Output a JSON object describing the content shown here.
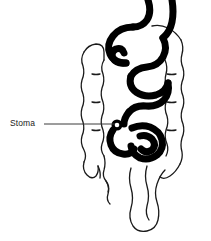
{
  "figure": {
    "background_color": "#ffffff",
    "width": 211,
    "height": 241
  },
  "labels": [
    {
      "id": "stoma",
      "text": "Stoma",
      "leader_line": {
        "from_x": 44,
        "to_x": 115,
        "y": 124,
        "color": "#3a3a3a",
        "width": 1
      }
    }
  ],
  "caption": {
    "cropped_text": "",
    "color": "#8c8c8c"
  },
  "structures": [
    {
      "id": "small-intestine",
      "name": "small intestine",
      "style": "thick solid stroke",
      "stroke_color": "#000000",
      "stroke_width": 7
    },
    {
      "id": "large-intestine",
      "name": "large intestine",
      "style": "thin wavy haustral outline",
      "stroke_color": "#1a1a1a",
      "stroke_width": 1.3
    },
    {
      "id": "stoma-opening",
      "name": "stoma opening",
      "style": "small ring",
      "stroke_color": "#000000",
      "stroke_width": 3,
      "cx": 117,
      "cy": 125,
      "r": 4
    }
  ]
}
